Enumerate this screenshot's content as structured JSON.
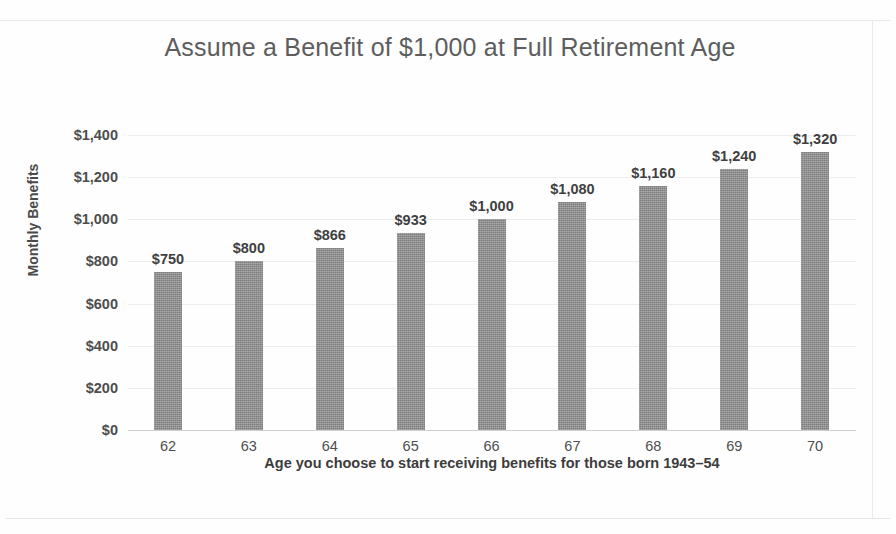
{
  "chart_data": {
    "type": "bar",
    "title": "Assume a Benefit of $1,000 at Full Retirement Age",
    "xlabel": "Age you choose to start receiving benefits for those born 1943–54",
    "ylabel": "Monthly Benefits",
    "categories": [
      "62",
      "63",
      "64",
      "65",
      "66",
      "67",
      "68",
      "69",
      "70"
    ],
    "values": [
      750,
      800,
      866,
      933,
      1000,
      1080,
      1160,
      1240,
      1320
    ],
    "data_labels": [
      "$750",
      "$800",
      "$866",
      "$933",
      "$1,000",
      "$1,080",
      "$1,160",
      "$1,240",
      "$1,320"
    ],
    "ylim": [
      0,
      1400
    ],
    "ytick_values": [
      1400,
      1200,
      1000,
      800,
      600,
      400,
      200,
      0
    ],
    "ytick_labels": [
      "$1,400",
      "$1,200",
      "$1,000",
      "$800",
      "$600",
      "$400",
      "$200",
      "$0"
    ],
    "grid": true,
    "legend": false,
    "series": [
      {
        "name": "Monthly Benefits",
        "values": [
          750,
          800,
          866,
          933,
          1000,
          1080,
          1160,
          1240,
          1320
        ],
        "color": "#8c8c8c"
      }
    ],
    "colors": {
      "bar": "#8c8c8c",
      "gridline": "#ededf0",
      "axis": "#cfcfd2",
      "title_text": "#5d5d5d",
      "label_text": "#3f3f3f",
      "background": "#fefefe"
    }
  }
}
